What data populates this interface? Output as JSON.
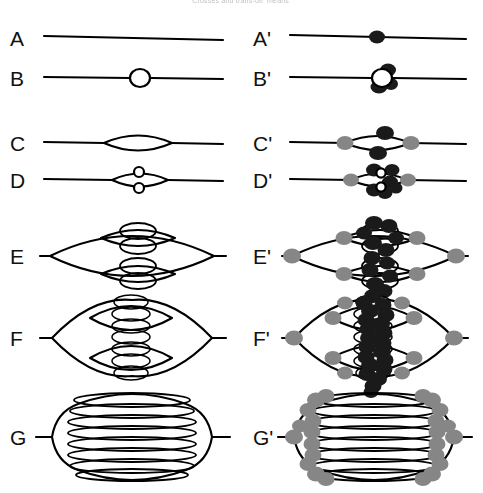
{
  "figure": {
    "caption_fragment": "Crosses and trans-off ‘means’",
    "background_color": "#ffffff",
    "ink_color": "#000000",
    "width": 483,
    "height": 493,
    "columns": [
      {
        "id": "plain",
        "description": "unlabeled graph topologies"
      },
      {
        "id": "primed",
        "description": "same topologies with marked vertices"
      }
    ],
    "node_legend": [
      {
        "name": "dark-node",
        "color": "#1a1a1a",
        "meaning": "black marked vertex"
      },
      {
        "name": "gray-node",
        "color": "#868686",
        "meaning": "gray marked vertex"
      },
      {
        "name": "open-node",
        "color": "#ffffff",
        "meaning": "open circle"
      }
    ]
  },
  "rows": [
    {
      "label": "A",
      "label_primed": "A'",
      "type": "straight-line",
      "description": "plain horizontal segment",
      "description_primed": "horizontal segment with one black node at centre",
      "lens_count": 0,
      "dark_nodes": 1,
      "gray_nodes": 0,
      "open_nodes": 0
    },
    {
      "label": "B",
      "label_primed": "B'",
      "type": "single-open-circle",
      "description": "horizontal segment interrupted by one open circle",
      "description_primed": "open circle flanked by black nodes",
      "lens_count": 0,
      "dark_nodes": 3,
      "gray_nodes": 0,
      "open_nodes": 1
    },
    {
      "label": "C",
      "label_primed": "C'",
      "type": "single-lens",
      "description": "one wide lens (bigon) on the axis",
      "description_primed": "lens with two black nodes on its arcs and gray nodes at both vertices",
      "lens_count": 1,
      "dark_nodes": 2,
      "gray_nodes": 2,
      "open_nodes": 0
    },
    {
      "label": "D",
      "label_primed": "D'",
      "type": "lens-with-two-circles",
      "description": "lens containing two small stacked open circles",
      "description_primed": "lens with black nodes clustered round the two inner circles and gray vertices",
      "lens_count": 1,
      "dark_nodes": 6,
      "gray_nodes": 2,
      "open_nodes": 2
    },
    {
      "label": "E",
      "label_primed": "E'",
      "type": "two-level-nest",
      "description": "outer lens split into two mid lenses, each holding two small lenses",
      "description_primed": "same with black nodes along the central spine and gray nodes at branch vertices",
      "lens_count": 7,
      "dark_nodes": 12,
      "gray_nodes": 6,
      "open_nodes": 0
    },
    {
      "label": "F",
      "label_primed": "F'",
      "type": "three-level-nest",
      "description": "outer lens split into two mid lenses, each holding four small lenses",
      "description_primed": "dense black spine with gray nodes at the outer branch vertices",
      "lens_count": 11,
      "dark_nodes": 22,
      "gray_nodes": 10,
      "open_nodes": 0
    },
    {
      "label": "G",
      "label_primed": "G'",
      "type": "ladder-stack",
      "description": "rounded outer loop enclosing eight flattened stacked lenses",
      "description_primed": "same stack with gray nodes clustered at the left and right vertex columns",
      "lens_count": 8,
      "dark_nodes": 0,
      "gray_nodes": 24,
      "open_nodes": 0
    }
  ]
}
